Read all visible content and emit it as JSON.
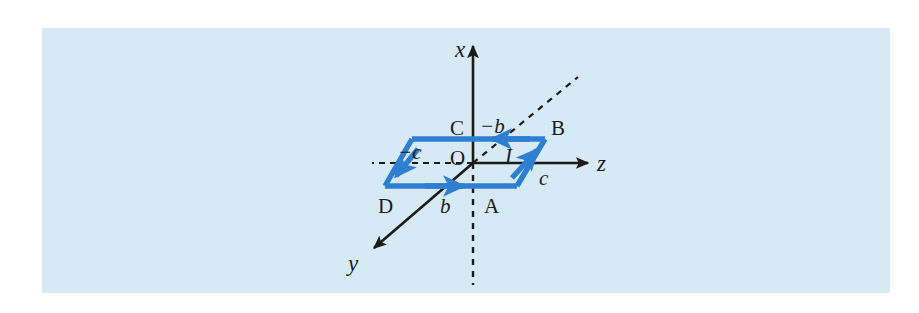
{
  "figure": {
    "background_color": "#ffffff",
    "panel_color": "#d6eaf6",
    "axis_color": "#1b1b1b",
    "loop_color": "#2e7fd0"
  },
  "axes": [
    {
      "id": "x",
      "label": "x",
      "kind": "solid",
      "direction": "up"
    },
    {
      "id": "y",
      "label": "y",
      "kind": "solid",
      "direction": "down-left"
    },
    {
      "id": "z",
      "label": "z",
      "kind": "solid",
      "direction": "right"
    },
    {
      "id": "neg-x",
      "label": "",
      "kind": "dashed",
      "direction": "down"
    },
    {
      "id": "neg-y",
      "label": "",
      "kind": "dashed",
      "direction": "up-right"
    },
    {
      "id": "neg-z",
      "label": "",
      "kind": "dashed",
      "direction": "left"
    }
  ],
  "origin": {
    "label": "O"
  },
  "vertices": [
    {
      "id": "A",
      "label": "A"
    },
    {
      "id": "B",
      "label": "B"
    },
    {
      "id": "C",
      "label": "C"
    },
    {
      "id": "D",
      "label": "D"
    }
  ],
  "dimensions": [
    {
      "id": "b-pos",
      "label": "b"
    },
    {
      "id": "b-neg",
      "label": "−b"
    },
    {
      "id": "c-pos",
      "label": "c"
    },
    {
      "id": "c-neg",
      "label": "−c"
    }
  ],
  "current": {
    "label": "I",
    "description": "current direction around loop"
  }
}
